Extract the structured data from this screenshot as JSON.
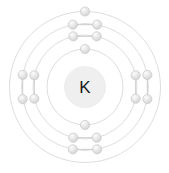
{
  "diagram": {
    "type": "bohr-atomic-model",
    "element_symbol": "K",
    "element_name": "Potassium",
    "atomic_number": 19,
    "shell_count": 4,
    "electron_configuration": "2-8-8-1",
    "canvas": {
      "width": 169,
      "height": 173
    },
    "center": {
      "x": 85,
      "y": 87
    },
    "colors": {
      "background": "#ffffff",
      "shell_stroke": "#d9d9d9",
      "nucleus_fill": "#efefef",
      "nucleus_stroke": "#e6e6e6",
      "electron_fill": "#e2e2e2",
      "electron_highlight": "#fbfbfb",
      "electron_stroke": "#c9c9c9",
      "connector_stroke": "#cfcfcf",
      "label_text": "#1a1a1a"
    },
    "nucleus": {
      "label": "K",
      "radius": 20.5
    },
    "shells": [
      {
        "index": 1,
        "name": "K-shell",
        "radius": 38,
        "electron_count": 2
      },
      {
        "index": 2,
        "name": "L-shell",
        "radius": 52,
        "electron_count": 8
      },
      {
        "index": 3,
        "name": "M-shell",
        "radius": 63.5,
        "electron_count": 8
      },
      {
        "index": 4,
        "name": "N-shell",
        "radius": 75.5,
        "electron_count": 1
      }
    ],
    "electron_radius": 4.6,
    "electrons": [
      {
        "shell": 1,
        "angle_deg": 90,
        "id": "e1-1"
      },
      {
        "shell": 1,
        "angle_deg": 270,
        "id": "e1-2"
      },
      {
        "shell": 2,
        "angle_deg": 77,
        "id": "e2-1"
      },
      {
        "shell": 2,
        "angle_deg": 103,
        "id": "e2-2"
      },
      {
        "shell": 2,
        "angle_deg": 167,
        "id": "e2-3"
      },
      {
        "shell": 2,
        "angle_deg": 193,
        "id": "e2-4"
      },
      {
        "shell": 2,
        "angle_deg": 257,
        "id": "e2-5"
      },
      {
        "shell": 2,
        "angle_deg": 283,
        "id": "e2-6"
      },
      {
        "shell": 2,
        "angle_deg": 347,
        "id": "e2-7"
      },
      {
        "shell": 2,
        "angle_deg": 13,
        "id": "e2-8"
      },
      {
        "shell": 3,
        "angle_deg": 79,
        "id": "e3-1"
      },
      {
        "shell": 3,
        "angle_deg": 101,
        "id": "e3-2"
      },
      {
        "shell": 3,
        "angle_deg": 169,
        "id": "e3-3"
      },
      {
        "shell": 3,
        "angle_deg": 191,
        "id": "e3-4"
      },
      {
        "shell": 3,
        "angle_deg": 259,
        "id": "e3-5"
      },
      {
        "shell": 3,
        "angle_deg": 281,
        "id": "e3-6"
      },
      {
        "shell": 3,
        "angle_deg": 349,
        "id": "e3-7"
      },
      {
        "shell": 3,
        "angle_deg": 11,
        "id": "e3-8"
      },
      {
        "shell": 4,
        "angle_deg": 90,
        "id": "e4-1"
      }
    ],
    "connectors": [
      {
        "shell": 2,
        "from": "e2-1",
        "to": "e2-2"
      },
      {
        "shell": 2,
        "from": "e2-3",
        "to": "e2-4"
      },
      {
        "shell": 2,
        "from": "e2-5",
        "to": "e2-6"
      },
      {
        "shell": 2,
        "from": "e2-7",
        "to": "e2-8"
      },
      {
        "shell": 3,
        "from": "e3-1",
        "to": "e3-2"
      },
      {
        "shell": 3,
        "from": "e3-3",
        "to": "e3-4"
      },
      {
        "shell": 3,
        "from": "e3-5",
        "to": "e3-6"
      },
      {
        "shell": 3,
        "from": "e3-7",
        "to": "e3-8"
      }
    ]
  }
}
